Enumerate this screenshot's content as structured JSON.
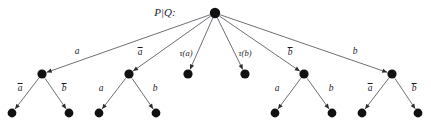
{
  "diagram": {
    "title_label": "P|Q:",
    "type": "labelled-transition-tree",
    "root": {
      "id": "root",
      "x": 215,
      "y": 13,
      "r": 5.2
    },
    "level1_nodes": [
      {
        "id": "n1",
        "x": 42,
        "y": 74,
        "r": 4.6,
        "kind": "branch"
      },
      {
        "id": "n2",
        "x": 129,
        "y": 74,
        "r": 4.6,
        "kind": "branch"
      },
      {
        "id": "n3",
        "x": 188,
        "y": 74,
        "r": 4.6,
        "kind": "leaf"
      },
      {
        "id": "n4",
        "x": 245,
        "y": 74,
        "r": 4.6,
        "kind": "leaf"
      },
      {
        "id": "n5",
        "x": 304,
        "y": 74,
        "r": 4.6,
        "kind": "branch"
      },
      {
        "id": "n6",
        "x": 392,
        "y": 74,
        "r": 4.6,
        "kind": "branch"
      }
    ],
    "level2_nodes": [
      {
        "id": "l1",
        "x": 12,
        "y": 113,
        "r": 4.4
      },
      {
        "id": "l2",
        "x": 69,
        "y": 113,
        "r": 4.4
      },
      {
        "id": "l3",
        "x": 99,
        "y": 113,
        "r": 4.4
      },
      {
        "id": "l4",
        "x": 156,
        "y": 113,
        "r": 4.4
      },
      {
        "id": "l5",
        "x": 275,
        "y": 113,
        "r": 4.4
      },
      {
        "id": "l6",
        "x": 332,
        "y": 113,
        "r": 4.4
      },
      {
        "id": "l7",
        "x": 362,
        "y": 113,
        "r": 4.4
      },
      {
        "id": "l8",
        "x": 418,
        "y": 113,
        "r": 4.4
      }
    ],
    "edges_level1": [
      {
        "from": "root",
        "to": "n1",
        "label": "a",
        "overline": false,
        "x1": 215,
        "y1": 13,
        "x2": 42,
        "y2": 74,
        "lx": 77,
        "ly": 52
      },
      {
        "from": "root",
        "to": "n2",
        "label": "a",
        "overline": true,
        "x1": 215,
        "y1": 13,
        "x2": 129,
        "y2": 74,
        "lx": 140,
        "ly": 52
      },
      {
        "from": "root",
        "to": "n3",
        "label": "τ(a)",
        "overline": false,
        "x1": 215,
        "y1": 13,
        "x2": 188,
        "y2": 74,
        "lx": 186,
        "ly": 53
      },
      {
        "from": "root",
        "to": "n4",
        "label": "τ(b)",
        "overline": false,
        "x1": 215,
        "y1": 13,
        "x2": 245,
        "y2": 74,
        "lx": 245,
        "ly": 53
      },
      {
        "from": "root",
        "to": "n5",
        "label": "b",
        "overline": true,
        "x1": 215,
        "y1": 13,
        "x2": 304,
        "y2": 74,
        "lx": 290,
        "ly": 52
      },
      {
        "from": "root",
        "to": "n6",
        "label": "b",
        "overline": false,
        "x1": 215,
        "y1": 13,
        "x2": 392,
        "y2": 74,
        "lx": 355,
        "ly": 52
      }
    ],
    "edges_level2": [
      {
        "from": "n1",
        "to": "l1",
        "label": "a",
        "overline": true,
        "x1": 42,
        "y1": 74,
        "x2": 12,
        "y2": 113,
        "lx": 20,
        "ly": 88
      },
      {
        "from": "n1",
        "to": "l2",
        "label": "b",
        "overline": true,
        "x1": 42,
        "y1": 74,
        "x2": 69,
        "y2": 113,
        "lx": 64,
        "ly": 88
      },
      {
        "from": "n2",
        "to": "l3",
        "label": "a",
        "overline": false,
        "x1": 129,
        "y1": 74,
        "x2": 99,
        "y2": 113,
        "lx": 101,
        "ly": 89
      },
      {
        "from": "n2",
        "to": "l4",
        "label": "b",
        "overline": false,
        "x1": 129,
        "y1": 74,
        "x2": 156,
        "y2": 113,
        "lx": 155,
        "ly": 89
      },
      {
        "from": "n5",
        "to": "l5",
        "label": "a",
        "overline": false,
        "x1": 304,
        "y1": 74,
        "x2": 275,
        "y2": 113,
        "lx": 277,
        "ly": 89
      },
      {
        "from": "n5",
        "to": "l6",
        "label": "b",
        "overline": false,
        "x1": 304,
        "y1": 74,
        "x2": 332,
        "y2": 113,
        "lx": 331,
        "ly": 89
      },
      {
        "from": "n6",
        "to": "l7",
        "label": "a",
        "overline": true,
        "x1": 392,
        "y1": 74,
        "x2": 362,
        "y2": 113,
        "lx": 370,
        "ly": 88
      },
      {
        "from": "n6",
        "to": "l8",
        "label": "b",
        "overline": true,
        "x1": 392,
        "y1": 74,
        "x2": 418,
        "y2": 113,
        "lx": 414,
        "ly": 88
      }
    ],
    "root_label_pos": {
      "x": 165,
      "y": 12
    },
    "colors": {
      "node": "#111111",
      "edge": "#4a4a52",
      "text": "#1b1b1f",
      "background": "#ffffff"
    }
  }
}
